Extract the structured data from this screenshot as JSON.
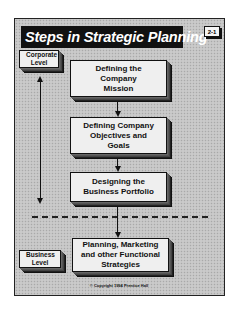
{
  "title": "Steps in Strategic Planning",
  "slide_number": "2-1",
  "levels": {
    "corporate": "Corporate Level",
    "business": "Business Level"
  },
  "steps": [
    {
      "label": "Defining the Company Mission"
    },
    {
      "label": "Defining Company Objectives and Goals"
    },
    {
      "label": "Designing the Business Portfolio"
    },
    {
      "label": "Planning, Marketing and other Functional Strategies"
    }
  ],
  "divider": "dashed line separating corporate level from business level",
  "copyright": "© Copyright 1994 Prentice Hall",
  "colors": {
    "background": "#c4c4c4",
    "box_fill": "#efefef",
    "title_bg": "#111111",
    "title_text": "#ffffff"
  }
}
